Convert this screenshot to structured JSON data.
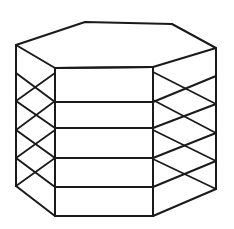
{
  "figure": {
    "kind": "line-drawing",
    "caption": "",
    "stroke_color": "#1a1a1a",
    "fill_color": "#ffffff",
    "background_color": "#ffffff",
    "stroke_width": 2,
    "canvas": {
      "width": 234,
      "height": 229
    },
    "shelf_count": 6,
    "side_count": 6,
    "projection": "axonometric",
    "geometry": {
      "hexagon_top_y": 22,
      "hexagon_bottom_y": 216,
      "vertex_names": [
        "back-left",
        "back-top",
        "back-right",
        "front-right",
        "front-center",
        "front-left"
      ],
      "hex_outline_offsets": [
        {
          "name": "left",
          "x": 16,
          "dy": 23
        },
        {
          "name": "back-left",
          "x": 85,
          "dy": 0
        },
        {
          "name": "back-right",
          "x": 172,
          "dy": 2
        },
        {
          "name": "right",
          "x": 216,
          "dy": 26
        },
        {
          "name": "front-right",
          "x": 153,
          "dy": 45
        },
        {
          "name": "front-left",
          "x": 55,
          "dy": 46
        }
      ],
      "shelf_front_y": [
        68,
        102,
        128,
        158,
        187,
        216
      ],
      "shelf_left_y": [
        45,
        73,
        101,
        130,
        158,
        186
      ],
      "shelf_right_y": [
        48,
        76,
        104,
        133,
        161,
        189
      ]
    }
  }
}
